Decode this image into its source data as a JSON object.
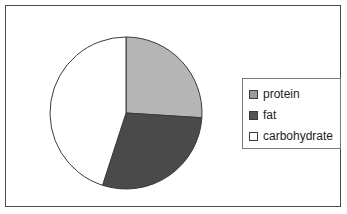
{
  "figure": {
    "background_color": "#ffffff",
    "frame_border_color": "#4a4a4a"
  },
  "legend": {
    "position": "right",
    "border_color": "#7a7a7a",
    "items": [
      {
        "label": "protein",
        "swatch_color": "#9a9a9a",
        "swatch_name": "legend-swatch-protein"
      },
      {
        "label": "fat",
        "swatch_color": "#555555",
        "swatch_name": "legend-swatch-fat"
      },
      {
        "label": "carbohydrate",
        "swatch_color": "#ffffff",
        "swatch_name": "legend-swatch-carbohydrate"
      }
    ]
  },
  "chart_data": {
    "type": "pie",
    "title": "",
    "xlabel": "",
    "ylabel": "",
    "labels": [
      "protein",
      "fat",
      "carbohydrate"
    ],
    "values": [
      26,
      29,
      45
    ],
    "unit": "percent",
    "start_angle_deg": 90,
    "direction": "clockwise",
    "slice_colors": [
      "#b5b5b5",
      "#4a4a4a",
      "#ffffff"
    ],
    "slice_edge_color": "#3a3a3a",
    "boundary_angles_deg": [
      90,
      -4.5,
      -108,
      90
    ],
    "legend_position": "right",
    "grid": false,
    "data_labels_shown": false
  }
}
